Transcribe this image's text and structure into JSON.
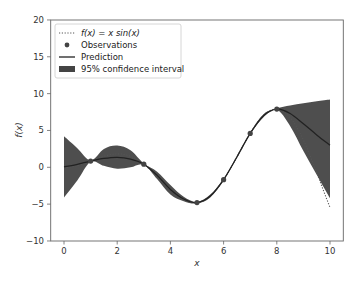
{
  "chart_data": {
    "type": "line",
    "title": "",
    "xlabel": "x",
    "ylabel": "f(x)",
    "xlim": [
      -0.5,
      10.5
    ],
    "ylim": [
      -10,
      20
    ],
    "xticks": [
      0,
      2,
      4,
      6,
      8,
      10
    ],
    "yticks": [
      -10,
      -5,
      0,
      5,
      10,
      15,
      20
    ],
    "grid": false,
    "legend_position": "upper left",
    "legend": [
      {
        "label": "f(x) = x sin(x)",
        "style": "dotted-line"
      },
      {
        "label": "Observations",
        "style": "marker"
      },
      {
        "label": "Prediction",
        "style": "solid-line"
      },
      {
        "label": "95% confidence interval",
        "style": "filled-patch"
      }
    ],
    "series": [
      {
        "name": "f(x) = x sin(x)",
        "kind": "function",
        "expression": "x*sin(x)",
        "x_range": [
          0,
          10
        ]
      },
      {
        "name": "Observations",
        "kind": "scatter",
        "x": [
          1,
          3,
          5,
          6,
          7,
          8
        ],
        "y": [
          0.84,
          0.42,
          -4.79,
          -1.68,
          4.6,
          7.91
        ]
      },
      {
        "name": "Prediction",
        "kind": "line",
        "x": [
          0,
          0.5,
          1,
          1.5,
          2,
          2.5,
          3,
          3.5,
          4,
          4.5,
          5,
          5.5,
          6,
          6.5,
          7,
          7.5,
          8,
          8.5,
          9,
          9.5,
          10
        ],
        "y": [
          0.05,
          0.4,
          0.84,
          1.2,
          1.35,
          1.1,
          0.42,
          -1.1,
          -3.0,
          -4.3,
          -4.79,
          -3.9,
          -1.68,
          1.4,
          4.6,
          7.0,
          7.91,
          7.3,
          5.9,
          4.4,
          3.0
        ]
      },
      {
        "name": "95% confidence interval",
        "kind": "band",
        "x": [
          0,
          0.5,
          1,
          1.5,
          2,
          2.5,
          3,
          3.5,
          4,
          4.5,
          5,
          5.5,
          6,
          6.5,
          7,
          7.5,
          8,
          8.5,
          9,
          9.5,
          10
        ],
        "upper": [
          4.2,
          2.6,
          0.95,
          2.5,
          2.95,
          2.3,
          0.5,
          -0.6,
          -2.4,
          -4.0,
          -4.7,
          -3.7,
          -1.55,
          1.5,
          4.7,
          7.2,
          8.0,
          8.4,
          8.7,
          8.95,
          9.2
        ],
        "lower": [
          -4.1,
          -1.8,
          0.75,
          0.2,
          -0.2,
          0.0,
          0.35,
          -1.6,
          -3.7,
          -4.6,
          -4.9,
          -4.1,
          -1.8,
          1.3,
          4.5,
          6.8,
          7.8,
          5.6,
          2.2,
          -1.0,
          -4.2
        ]
      }
    ]
  },
  "colors": {
    "function_line": "#555555",
    "observation_marker": "#444444",
    "prediction_line": "#222222",
    "band_fill": "#444444",
    "axis": "#666666"
  }
}
